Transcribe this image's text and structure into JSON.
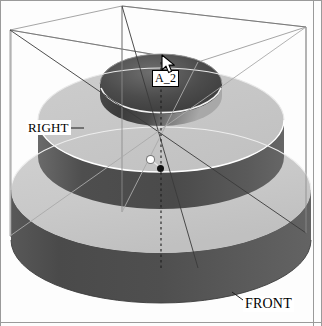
{
  "app": {
    "window_name": "cad-3d-viewport",
    "background_color": "#fdfdfd"
  },
  "viewport": {
    "name": "3d-model-viewport",
    "projection": "isometric",
    "model_description": "stepped cylindrical part with concentric central bore"
  },
  "labels": {
    "axis": "A_2",
    "right_plane": "RIGHT",
    "front_plane": "FRONT"
  },
  "colors": {
    "top_face_light": "#c9c9c9",
    "top_face_light_2": "#cfcfcf",
    "side_dark": "#4d4d4d",
    "side_dark_lower": "#585858",
    "bore_dark": "#3a3a3a",
    "bore_highlight": "#b4b4b4",
    "wireframe": "#8e8e8e",
    "wireframe_dark": "#4a4a4a",
    "axis_line": "#2a2a2a",
    "highlight_edge": "#ffffff",
    "label_text": "#000000",
    "label_bg": "#ffffff",
    "film_edge": "#9a9a9a"
  },
  "selection": {
    "highlighted_vertex": "white-vertex-marker",
    "picked_point": "black-point-marker",
    "selected_feature": "A_2"
  },
  "cursor": {
    "type": "arrow-pointer",
    "x": 161,
    "y": 54
  },
  "geometry": {
    "bounding_box": "wireframe-datum-box",
    "datum_axis": "A_2",
    "datum_planes": [
      "RIGHT",
      "FRONT"
    ]
  }
}
